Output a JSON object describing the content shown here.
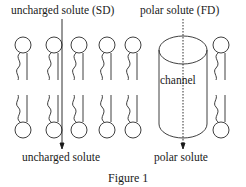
{
  "diagram": {
    "top_labels": {
      "left": "uncharged solute (SD)",
      "right": "polar solute (FD)"
    },
    "channel_label": "channel",
    "bottom_labels": {
      "left": "uncharged solute",
      "right": "polar solute"
    },
    "caption": "Figure 1"
  }
}
